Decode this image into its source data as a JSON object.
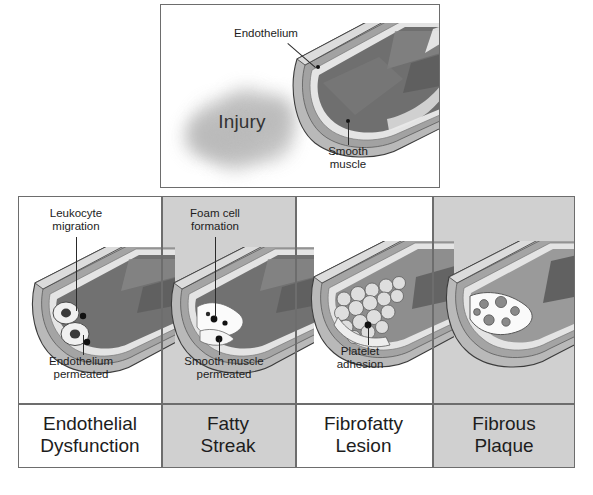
{
  "figure": {
    "title_visible": false,
    "type": "atherosclerosis-progression-diagram"
  },
  "injury_panel": {
    "name": "injury-panel",
    "label": "Injury",
    "annotations": [
      {
        "id": "endothelium",
        "text": "Endothelium"
      },
      {
        "id": "smooth-muscle",
        "text": "Smooth\nmuscle"
      }
    ]
  },
  "stages": [
    {
      "id": "endothelial-dysfunction",
      "caption": "Endothelial\nDysfunction",
      "background": "white",
      "annotations": [
        {
          "id": "leukocyte-migration",
          "text": "Leukocyte\nmigration"
        },
        {
          "id": "endothelium-permeated",
          "text": "Endothelium\npermeated"
        }
      ]
    },
    {
      "id": "fatty-streak",
      "caption": "Fatty\nStreak",
      "background": "gray",
      "annotations": [
        {
          "id": "foam-cell-formation",
          "text": "Foam cell\nformation"
        },
        {
          "id": "smooth-muscle-permeated",
          "text": "Smooth muscle\npermeated"
        }
      ]
    },
    {
      "id": "fibrofatty-lesion",
      "caption": "Fibrofatty\nLesion",
      "background": "white",
      "annotations": [
        {
          "id": "platelet-adhesion",
          "text": "Platelet\nadhesion"
        }
      ]
    },
    {
      "id": "fibrous-plaque",
      "caption": "Fibrous\nPlaque",
      "background": "gray",
      "annotations": []
    }
  ],
  "colors": {
    "frame_border": "#6d6d6d",
    "panel_shaded": "#d0d0d0",
    "panel_plain": "#ffffff",
    "text": "#1d1d1d",
    "injury_cloud": "#b9b9b9",
    "vessel_outer": "#b4b4b4",
    "vessel_media": "#9a9a9a",
    "vessel_lumen": "#6f6f6f",
    "vessel_intima": "#e2e2e2",
    "vessel_dark": "#4d4d4d",
    "cell_fill": "#f2f2f2"
  }
}
